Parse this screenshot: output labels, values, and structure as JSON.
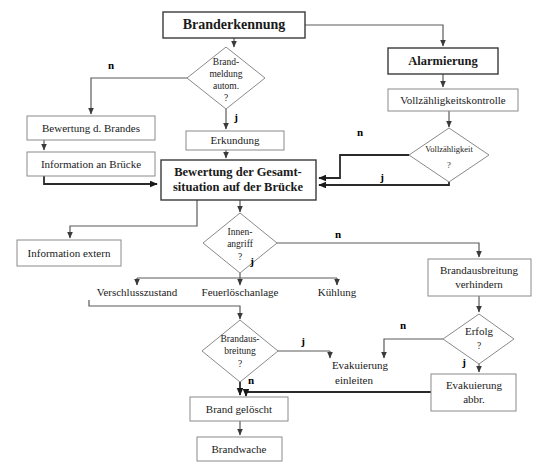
{
  "diagram": {
    "title": "Branderkennung",
    "language": "de",
    "nodes": [
      {
        "id": "branderkennung",
        "label": "Branderkennung",
        "shape": "box",
        "emphasis": "title",
        "x": 163,
        "y": 12,
        "w": 142,
        "h": 26
      },
      {
        "id": "alarmierung",
        "label": "Alarmierung",
        "shape": "box",
        "emphasis": "bold",
        "x": 388,
        "y": 48,
        "w": 110,
        "h": 26
      },
      {
        "id": "vollzaehligkeitskontrolle",
        "label": "Vollzähligkeitskontrolle",
        "shape": "box",
        "emphasis": "normal",
        "x": 388,
        "y": 89,
        "w": 130,
        "h": 22
      },
      {
        "id": "brandmeldung-autom",
        "label": "Brand-\nmeldung\nautom.\n?",
        "shape": "diamond",
        "emphasis": "small",
        "x": 187,
        "y": 47,
        "w": 78,
        "h": 62
      },
      {
        "id": "vollzaehligkeit",
        "label": "Vollzähligkeit\n?",
        "shape": "diamond",
        "emphasis": "tiny",
        "x": 409,
        "y": 128,
        "w": 80,
        "h": 54
      },
      {
        "id": "bewertung-brandes",
        "label": "Bewertung d. Brandes",
        "shape": "box",
        "emphasis": "normal",
        "x": 27,
        "y": 116,
        "w": 128,
        "h": 24
      },
      {
        "id": "information-bruecke",
        "label": "Information an Brücke",
        "shape": "box",
        "emphasis": "normal",
        "x": 27,
        "y": 152,
        "w": 128,
        "h": 24
      },
      {
        "id": "erkundung",
        "label": "Erkundung",
        "shape": "box",
        "emphasis": "normal",
        "x": 186,
        "y": 131,
        "w": 98,
        "h": 19
      },
      {
        "id": "bewertung-gesamtsituation",
        "label": "Bewertung der Gesamt-\nsituation auf der Brücke",
        "shape": "box",
        "emphasis": "bold",
        "x": 161,
        "y": 160,
        "w": 155,
        "h": 40
      },
      {
        "id": "innenangriff",
        "label": "Innen-\nangriff\n?",
        "shape": "diamond",
        "emphasis": "small",
        "x": 203,
        "y": 213,
        "w": 74,
        "h": 60
      },
      {
        "id": "information-extern",
        "label": "Information extern",
        "shape": "box",
        "emphasis": "normal",
        "x": 17,
        "y": 240,
        "w": 104,
        "h": 26
      },
      {
        "id": "verschlusszustand",
        "label": "Verschlusszustand",
        "shape": "text",
        "emphasis": "normal",
        "x": 103,
        "y": 288,
        "w": 100,
        "h": 16
      },
      {
        "id": "feuerloeschanlage",
        "label": "Feuerlöschanlage",
        "shape": "text",
        "emphasis": "normal",
        "x": 200,
        "y": 288,
        "w": 100,
        "h": 16
      },
      {
        "id": "kuehlung",
        "label": "Kühlung",
        "shape": "text",
        "emphasis": "normal",
        "x": 303,
        "y": 288,
        "w": 66,
        "h": 16
      },
      {
        "id": "brandausbreitung-verhindern",
        "label": "Brandausbreitung\nverhindern",
        "shape": "box",
        "emphasis": "normal",
        "x": 428,
        "y": 259,
        "w": 103,
        "h": 37
      },
      {
        "id": "brandausbreitung-q",
        "label": "Brandaus-\nbreitung\n?",
        "shape": "diamond",
        "emphasis": "small",
        "x": 202,
        "y": 320,
        "w": 76,
        "h": 62
      },
      {
        "id": "erfolg",
        "label": "Erfolg\n?",
        "shape": "diamond",
        "emphasis": "normal",
        "x": 443,
        "y": 314,
        "w": 70,
        "h": 50
      },
      {
        "id": "evakuierung-einleiten",
        "label": "Evakuierung\neinleiten",
        "shape": "text",
        "emphasis": "normal",
        "x": 330,
        "y": 358,
        "w": 80,
        "h": 32
      },
      {
        "id": "evakuierung-abbr",
        "label": "Evakuierung\nabbr.",
        "shape": "box",
        "emphasis": "normal",
        "x": 431,
        "y": 374,
        "w": 85,
        "h": 37
      },
      {
        "id": "brand-geloescht",
        "label": "Brand gelöscht",
        "shape": "box",
        "emphasis": "normal",
        "x": 190,
        "y": 397,
        "w": 98,
        "h": 24
      },
      {
        "id": "brandwache",
        "label": "Brandwache",
        "shape": "box",
        "emphasis": "normal",
        "x": 197,
        "y": 437,
        "w": 85,
        "h": 24
      }
    ],
    "branch_labels": [
      {
        "id": "n-brandmeldung",
        "text": "n",
        "x": 111,
        "y": 66
      },
      {
        "id": "j-brandmeldung",
        "text": "j",
        "x": 236,
        "y": 118
      },
      {
        "id": "n-vollzaehligkeit",
        "text": "n",
        "x": 360,
        "y": 133
      },
      {
        "id": "j-vollzaehligkeit",
        "text": "j",
        "x": 382,
        "y": 181
      },
      {
        "id": "n-innenangriff",
        "text": "n",
        "x": 338,
        "y": 235
      },
      {
        "id": "j-innenangriff",
        "text": "j",
        "x": 250,
        "y": 262
      },
      {
        "id": "j-brandausbreitung",
        "text": "j",
        "x": 303,
        "y": 341
      },
      {
        "id": "n-brandausbreitung",
        "text": "n",
        "x": 249,
        "y": 383
      },
      {
        "id": "n-erfolg",
        "text": "n",
        "x": 403,
        "y": 324
      },
      {
        "id": "j-erfolg",
        "text": "j",
        "x": 464,
        "y": 363
      }
    ],
    "edges": [
      {
        "id": "branderkennung-to-brandmeldung",
        "from": "branderkennung",
        "to": "brandmeldung-autom"
      },
      {
        "id": "branderkennung-to-alarmierung",
        "from": "branderkennung",
        "to": "alarmierung"
      },
      {
        "id": "alarmierung-to-vollzaehligkeitskontrolle",
        "from": "alarmierung",
        "to": "vollzaehligkeitskontrolle"
      },
      {
        "id": "vollzaehligkeitskontrolle-to-vollzaehligkeit",
        "from": "vollzaehligkeitskontrolle",
        "to": "vollzaehligkeit"
      },
      {
        "id": "brandmeldung-n-to-bewertung-brandes",
        "from": "brandmeldung-autom",
        "to": "bewertung-brandes",
        "label": "n"
      },
      {
        "id": "brandmeldung-j-to-erkundung",
        "from": "brandmeldung-autom",
        "to": "erkundung",
        "label": "j"
      },
      {
        "id": "bewertung-brandes-to-information-bruecke",
        "from": "bewertung-brandes",
        "to": "information-bruecke"
      },
      {
        "id": "information-bruecke-to-gesamtsituation",
        "from": "information-bruecke",
        "to": "bewertung-gesamtsituation"
      },
      {
        "id": "erkundung-to-gesamtsituation",
        "from": "erkundung",
        "to": "bewertung-gesamtsituation"
      },
      {
        "id": "vollzaehligkeit-n-to-gesamtsituation",
        "from": "vollzaehligkeit",
        "to": "bewertung-gesamtsituation",
        "label": "n"
      },
      {
        "id": "vollzaehligkeit-j-to-gesamtsituation",
        "from": "vollzaehligkeit",
        "to": "bewertung-gesamtsituation",
        "label": "j"
      },
      {
        "id": "gesamtsituation-to-innenangriff",
        "from": "bewertung-gesamtsituation",
        "to": "innenangriff"
      },
      {
        "id": "gesamtsituation-to-information-extern",
        "from": "bewertung-gesamtsituation",
        "to": "information-extern"
      },
      {
        "id": "innenangriff-n-to-brandausbreitung-verhindern",
        "from": "innenangriff",
        "to": "brandausbreitung-verhindern",
        "label": "n"
      },
      {
        "id": "innenangriff-j-to-massnahmen",
        "from": "innenangriff",
        "to": "feuerloeschanlage",
        "label": "j"
      },
      {
        "id": "massnahmen-to-brandausbreitung-q",
        "from": "feuerloeschanlage",
        "to": "brandausbreitung-q"
      },
      {
        "id": "brandausbreitung-j-to-evakuierung-einleiten",
        "from": "brandausbreitung-q",
        "to": "evakuierung-einleiten",
        "label": "j"
      },
      {
        "id": "brandausbreitung-n-to-brand-geloescht",
        "from": "brandausbreitung-q",
        "to": "brand-geloescht",
        "label": "n"
      },
      {
        "id": "brandausbreitung-verhindern-to-erfolg",
        "from": "brandausbreitung-verhindern",
        "to": "erfolg"
      },
      {
        "id": "erfolg-n-to-evakuierung-einleiten",
        "from": "erfolg",
        "to": "evakuierung-einleiten",
        "label": "n"
      },
      {
        "id": "erfolg-j-to-evakuierung-abbr",
        "from": "erfolg",
        "to": "evakuierung-abbr",
        "label": "j"
      },
      {
        "id": "evakuierung-abbr-to-brand-geloescht",
        "from": "evakuierung-abbr",
        "to": "brand-geloescht"
      },
      {
        "id": "brand-geloescht-to-brandwache",
        "from": "brand-geloescht",
        "to": "brandwache"
      }
    ]
  },
  "colors": {
    "background": "#ffffff",
    "box_stroke": "#8a8a8a",
    "box_stroke_dark": "#3a3a3a",
    "edge": "#5a5a5a",
    "edge_thick": "#2a2a2a",
    "text": "#1a1a1a"
  }
}
